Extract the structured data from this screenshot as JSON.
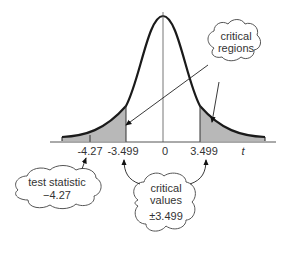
{
  "diagram": {
    "axis": {
      "variable_label": "t",
      "tick_labels": [
        "-4.27",
        "-3.499",
        "0",
        "3.499"
      ]
    },
    "callouts": {
      "critical_regions": {
        "line1": "critical",
        "line2": "regions"
      },
      "test_statistic": {
        "line1": "test statistic",
        "line2": "−4.27"
      },
      "critical_values": {
        "line1": "critical",
        "line2": "values",
        "line3": "±3.499"
      }
    },
    "colors": {
      "curve": "#1a1a1a",
      "shading": "#b8b8b8",
      "axis": "#555555",
      "text": "#333333"
    }
  }
}
